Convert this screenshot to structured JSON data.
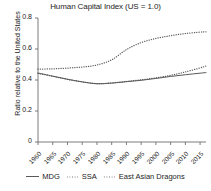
{
  "chart_data": {
    "type": "line",
    "title": "Human Capital Index (US = 1.0)",
    "xlabel": "",
    "ylabel": "Ratio relative to the United States",
    "ylim": [
      0,
      0.8
    ],
    "yticks": [
      "0",
      "0.2",
      "0.4",
      "0.6",
      "0.8"
    ],
    "ytick_values": [
      0,
      0.2,
      0.4,
      0.6,
      0.8
    ],
    "xlim": [
      1960,
      2017
    ],
    "xticks": [
      "1960",
      "1965",
      "1970",
      "1975",
      "1980",
      "1985",
      "1990",
      "1995",
      "2000",
      "2005",
      "2010",
      "2015"
    ],
    "xtick_values": [
      1960,
      1965,
      1970,
      1975,
      1980,
      1985,
      1990,
      1995,
      2000,
      2005,
      2010,
      2015
    ],
    "grid": false,
    "legend_position": "bottom",
    "x": [
      1960,
      1965,
      1970,
      1975,
      1980,
      1985,
      1990,
      1995,
      2000,
      2005,
      2010,
      2015,
      2017
    ],
    "series": [
      {
        "name": "MDG",
        "style": "solid",
        "color": "#595959",
        "values": [
          0.445,
          0.425,
          0.405,
          0.388,
          0.376,
          0.38,
          0.389,
          0.398,
          0.41,
          0.423,
          0.434,
          0.444,
          0.448
        ]
      },
      {
        "name": "SSA",
        "style": "dotted",
        "color": "#595959",
        "values": [
          0.443,
          0.424,
          0.404,
          0.388,
          0.376,
          0.381,
          0.391,
          0.401,
          0.414,
          0.43,
          0.452,
          0.478,
          0.49
        ]
      },
      {
        "name": "East Asian Dragons",
        "style": "dotted",
        "color": "#595959",
        "values": [
          0.47,
          0.472,
          0.477,
          0.484,
          0.497,
          0.53,
          0.596,
          0.641,
          0.668,
          0.686,
          0.7,
          0.709,
          0.711
        ]
      }
    ]
  },
  "legend": {
    "items": [
      {
        "label": "MDG",
        "style": "solid"
      },
      {
        "label": "SSA",
        "style": "dotted"
      },
      {
        "label": "East Asian Dragons",
        "style": "dotted"
      }
    ]
  }
}
